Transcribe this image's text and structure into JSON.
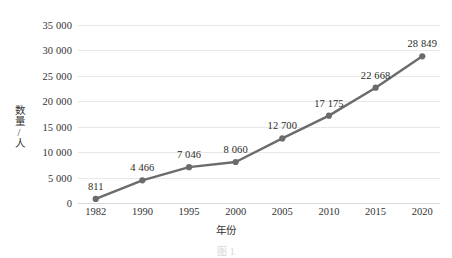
{
  "chart_data": {
    "type": "line",
    "title": "",
    "subtitle": "",
    "xlabel": "年份",
    "ylabel": "数量/人",
    "categories": [
      "1982",
      "1990",
      "1995",
      "2000",
      "2005",
      "2010",
      "2015",
      "2020"
    ],
    "values": [
      811,
      4466,
      7046,
      8060,
      12700,
      17175,
      22668,
      28849
    ],
    "point_labels": [
      "811",
      "4 466",
      "7 046",
      "8 060",
      "12 700",
      "17 175",
      "22 668",
      "28 849"
    ],
    "series": [
      {
        "name": "数量/人",
        "values": [
          811,
          4466,
          7046,
          8060,
          12700,
          17175,
          22668,
          28849
        ]
      }
    ],
    "ylim": [
      0,
      35000
    ],
    "ytick_values": [
      0,
      5000,
      10000,
      15000,
      20000,
      25000,
      30000,
      35000
    ],
    "ytick_labels": [
      "0",
      "5 000",
      "10 000",
      "15 000",
      "20 000",
      "25 000",
      "30 000",
      "35 000"
    ],
    "grid": "horizontal",
    "legend": "none",
    "marker": "circle",
    "series_color": "#6b6b6b",
    "grid_color": "#e8e8e8",
    "background_color": "#ffffff"
  },
  "caption": {
    "text": "图 1"
  }
}
